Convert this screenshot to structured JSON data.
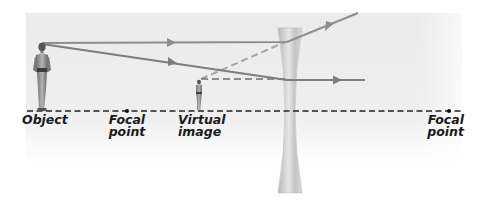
{
  "diagram": {
    "colors": {
      "background_panel": "#ececec",
      "ray": "#8a8a8a",
      "axis": "#222222",
      "lens": "#c9c9c9",
      "label": "#1a1a1a"
    },
    "labels": {
      "object": "Object",
      "focal_point_left_line1": "Focal",
      "focal_point_left_line2": "point",
      "virtual_image_line1": "Virtual",
      "virtual_image_line2": "image",
      "focal_point_right_line1": "Focal",
      "focal_point_right_line2": "point"
    },
    "elements": {
      "object": "standing person (full size)",
      "virtual_image": "standing person (reduced, upright)",
      "lens": "concave (diverging) lens",
      "rays": [
        "parallel ray refracted upward",
        "ray toward lens center continuing straight"
      ],
      "construction_lines": [
        "dashed back-extension of diverged ray",
        "dashed horizontal to image head"
      ]
    }
  }
}
